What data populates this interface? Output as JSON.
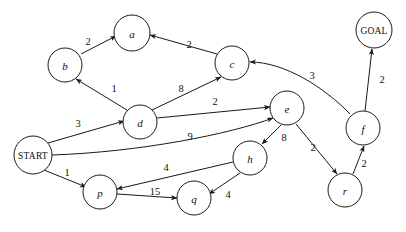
{
  "diagram": {
    "background_color": "#ffffff",
    "stroke_color": "#1a1a1a",
    "width": 406,
    "height": 232
  },
  "nodes": [
    {
      "id": "a",
      "label": "a",
      "x": 132,
      "y": 33,
      "r": 18,
      "kind": "state"
    },
    {
      "id": "b",
      "label": "b",
      "x": 65,
      "y": 65,
      "r": 17,
      "kind": "state"
    },
    {
      "id": "c",
      "label": "c",
      "x": 232,
      "y": 63,
      "r": 17,
      "kind": "state"
    },
    {
      "id": "d",
      "label": "d",
      "x": 140,
      "y": 122,
      "r": 17,
      "kind": "state"
    },
    {
      "id": "e",
      "label": "e",
      "x": 287,
      "y": 108,
      "r": 17,
      "kind": "state"
    },
    {
      "id": "f",
      "label": "f",
      "x": 363,
      "y": 128,
      "r": 17,
      "kind": "state"
    },
    {
      "id": "h",
      "label": "h",
      "x": 250,
      "y": 158,
      "r": 17,
      "kind": "state"
    },
    {
      "id": "p",
      "label": "p",
      "x": 100,
      "y": 192,
      "r": 17,
      "kind": "state"
    },
    {
      "id": "q",
      "label": "q",
      "x": 194,
      "y": 198,
      "r": 17,
      "kind": "state"
    },
    {
      "id": "r",
      "label": "r",
      "x": 345,
      "y": 190,
      "r": 17,
      "kind": "state"
    },
    {
      "id": "START",
      "label": "START",
      "x": 33,
      "y": 155,
      "r": 19,
      "kind": "start"
    },
    {
      "id": "GOAL",
      "label": "GOAL",
      "x": 374,
      "y": 30,
      "r": 18,
      "kind": "goal"
    }
  ],
  "edges": [
    {
      "from": "b",
      "to": "a",
      "weight": "2",
      "label_x": 88,
      "label_y": 41,
      "path": "M 81 54 L 116 36",
      "curved": false
    },
    {
      "from": "c",
      "to": "a",
      "weight": "2",
      "label_x": 189,
      "label_y": 44,
      "path": "M 217 54 L 150 35",
      "curved": false
    },
    {
      "from": "d",
      "to": "b",
      "weight": "1",
      "label_x": 114,
      "label_y": 88,
      "path": "M 127 110 L 76 79",
      "curved": false
    },
    {
      "from": "d",
      "to": "c",
      "weight": "8",
      "label_x": 181,
      "label_y": 88,
      "path": "M 152 110 L 221 77",
      "curved": false
    },
    {
      "from": "d",
      "to": "e",
      "weight": "2",
      "label_x": 215,
      "label_y": 101,
      "path": "M 157 118 L 270 107",
      "curved": false
    },
    {
      "from": "START",
      "to": "d",
      "weight": "3",
      "label_x": 78,
      "label_y": 123,
      "path": "M 48 143 L 124 121",
      "curved": false
    },
    {
      "from": "START",
      "to": "e",
      "weight": "9",
      "label_x": 190,
      "label_y": 136,
      "path": "M 52 155 C 140 152 230 134 273 118",
      "curved": true
    },
    {
      "from": "START",
      "to": "p",
      "weight": "1",
      "label_x": 67,
      "label_y": 172,
      "path": "M 44 170 L 86 187",
      "curved": false
    },
    {
      "from": "p",
      "to": "q",
      "weight": "15",
      "label_x": 155,
      "label_y": 191,
      "path": "M 117 194 L 177 198",
      "curved": false
    },
    {
      "from": "h",
      "to": "p",
      "weight": "4",
      "label_x": 166,
      "label_y": 167,
      "path": "M 233 162 L 117 189",
      "curved": false
    },
    {
      "from": "h",
      "to": "q",
      "weight": "4",
      "label_x": 228,
      "label_y": 194,
      "path": "M 240 173 L 209 194",
      "curved": false
    },
    {
      "from": "e",
      "to": "h",
      "weight": "8",
      "label_x": 284,
      "label_y": 137,
      "path": "M 281 125 L 262 144",
      "curved": false
    },
    {
      "from": "e",
      "to": "r",
      "weight": "2",
      "label_x": 313,
      "label_y": 147,
      "path": "M 296 124 L 337 174",
      "curved": false
    },
    {
      "from": "r",
      "to": "f",
      "weight": "2",
      "label_x": 364,
      "label_y": 163,
      "path": "M 353 174 L 364 146",
      "curved": false
    },
    {
      "from": "f",
      "to": "GOAL",
      "weight": "2",
      "label_x": 382,
      "label_y": 79,
      "path": "M 365 111 L 372 49",
      "curved": false
    },
    {
      "from": "f",
      "to": "c",
      "weight": "3",
      "label_x": 312,
      "label_y": 75,
      "path": "M 350 114 C 325 88 285 62 250 62",
      "curved": true
    }
  ]
}
